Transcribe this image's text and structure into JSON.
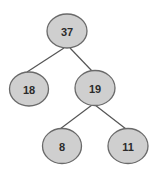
{
  "diagram": {
    "type": "binary-tree",
    "colors": {
      "node_fill": "#cfcfcf",
      "node_stroke": "#6a6a6a",
      "edge": "#555555",
      "text": "#2b2b2b"
    },
    "nodes": [
      {
        "id": "n37",
        "label": "37",
        "cx": 67,
        "cy": 31,
        "rx": 20,
        "ry": 17
      },
      {
        "id": "n18",
        "label": "18",
        "cx": 29,
        "cy": 89,
        "rx": 19.5,
        "ry": 17
      },
      {
        "id": "n19",
        "label": "19",
        "cx": 95,
        "cy": 88,
        "rx": 20,
        "ry": 17.5
      },
      {
        "id": "n8",
        "label": "8",
        "cx": 62,
        "cy": 146,
        "rx": 19.5,
        "ry": 17.5
      },
      {
        "id": "n11",
        "label": "11",
        "cx": 128,
        "cy": 146,
        "rx": 20,
        "ry": 17.5
      }
    ],
    "edges": [
      {
        "from": "37",
        "to": "18",
        "x1": 64,
        "y1": 48,
        "x2": 27,
        "y2": 72
      },
      {
        "from": "37",
        "to": "19",
        "x1": 70,
        "y1": 48,
        "x2": 92,
        "y2": 71
      },
      {
        "from": "19",
        "to": "8",
        "x1": 92,
        "y1": 105,
        "x2": 60,
        "y2": 129
      },
      {
        "from": "19",
        "to": "11",
        "x1": 95,
        "y1": 105,
        "x2": 126,
        "y2": 129
      }
    ]
  }
}
